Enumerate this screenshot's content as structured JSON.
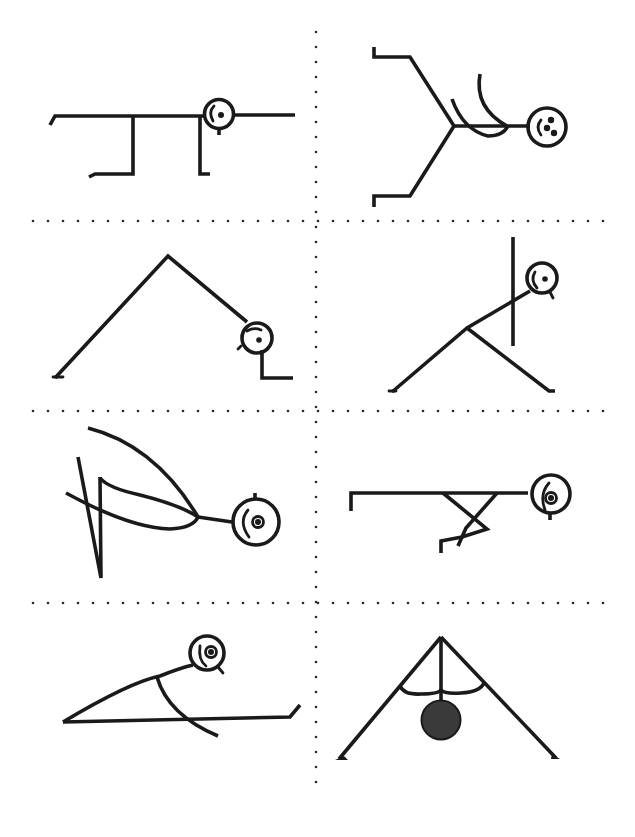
{
  "sheet": {
    "title": "Stick figure pose sheet",
    "layout": {
      "rows": 4,
      "columns": 2,
      "divider_style": "dotted"
    },
    "ink_color": "#1a1a1a",
    "ball_color": "#3a3a3a",
    "background_color": "#ffffff"
  },
  "poses": [
    {
      "id": "table-top",
      "row": 1,
      "col": 1,
      "description": "Horizontal body on two bent legs with head at right, arm extended forward"
    },
    {
      "id": "seated-split",
      "row": 1,
      "col": 2,
      "description": "Figure lying with legs in a V, arms curved overhead, face with two eyes"
    },
    {
      "id": "downward-dog",
      "row": 2,
      "col": 1,
      "description": "Inverted V shape, head near the ground at right"
    },
    {
      "id": "triangle-twist",
      "row": 2,
      "col": 2,
      "description": "Wide-legged stance with torso diagonal and vertical arm"
    },
    {
      "id": "bow-backbend",
      "row": 3,
      "col": 1,
      "description": "Curved back bend with legs kicked back"
    },
    {
      "id": "plank-crossed-legs",
      "row": 3,
      "col": 2,
      "description": "Horizontal plank with crossed bent legs below"
    },
    {
      "id": "forward-lunge-stretch",
      "row": 4,
      "col": 1,
      "description": "Low stretch with long straight leg and curved torso"
    },
    {
      "id": "wide-leg-forward-fold",
      "row": 4,
      "col": 2,
      "description": "Inverted V legs with head hanging as a filled ball and arms curving"
    }
  ]
}
